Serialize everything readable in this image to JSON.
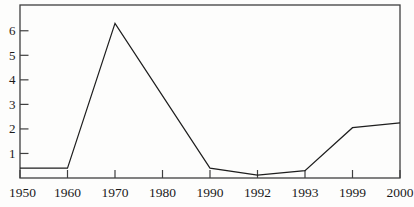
{
  "figure": {
    "background": "#fdfdfc",
    "frame_color": "#3f3f3f",
    "line_color": "#1e1e1e",
    "label_color": "#1a1a1a"
  },
  "chart_data": {
    "type": "line",
    "title": "",
    "xlabel": "",
    "ylabel": "",
    "x_categories": [
      "1950",
      "1960",
      "1970",
      "1980",
      "1990",
      "1992",
      "1993",
      "1999",
      "2000"
    ],
    "y_ticks": [
      1,
      2,
      3,
      4,
      5,
      6
    ],
    "ylim": [
      0,
      7.05
    ],
    "grid": false,
    "legend": "none",
    "tick_style": "inward",
    "series": [
      {
        "name": "value",
        "points": [
          {
            "x": "1950",
            "y": 0.4
          },
          {
            "x": "1960",
            "y": 0.4
          },
          {
            "x": "1970",
            "y": 6.3
          },
          {
            "x": "1990",
            "y": 0.4
          },
          {
            "x": "1992",
            "y": 0.12
          },
          {
            "x": "1993",
            "y": 0.3
          },
          {
            "x": "1999",
            "y": 2.05
          },
          {
            "x": "2000",
            "y": 2.25
          }
        ]
      }
    ]
  }
}
